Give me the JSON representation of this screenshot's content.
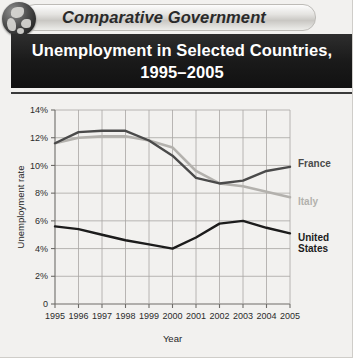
{
  "eyebrow": {
    "label": "Comparative Government",
    "icon": "globe-icon"
  },
  "title": {
    "line1": "Unemployment in Selected Countries,",
    "line2": "1995–2005"
  },
  "colors": {
    "page_background": "#f2f1ef",
    "title_bar": "#1a1a1a",
    "title_text": "#ffffff",
    "grid": "#a8a6a3",
    "axis": "#6e6c69",
    "france": "#4a4a4a",
    "italy": "#b3b1ad",
    "united_states": "#1c1c1c"
  },
  "chart_data": {
    "type": "line",
    "title": "Unemployment in Selected Countries, 1995–2005",
    "xlabel": "Year",
    "ylabel": "Unemployment rate",
    "x": [
      1995,
      1996,
      1997,
      1998,
      1999,
      2000,
      2001,
      2002,
      2003,
      2004,
      2005
    ],
    "categories": [
      "1995",
      "1996",
      "1997",
      "1998",
      "1999",
      "2000",
      "2001",
      "2002",
      "2003",
      "2004",
      "2005"
    ],
    "ylim": [
      0,
      14
    ],
    "yticks": [
      0,
      2,
      4,
      6,
      8,
      10,
      12,
      14
    ],
    "ytick_labels": [
      "0",
      "2%",
      "4%",
      "6%",
      "8%",
      "10%",
      "12%",
      "14%"
    ],
    "grid": true,
    "legend_position": "right-inline",
    "series": [
      {
        "name": "France",
        "color": "#4a4a4a",
        "values": [
          11.6,
          12.4,
          12.5,
          12.5,
          11.8,
          10.7,
          9.1,
          8.7,
          8.9,
          9.6,
          9.9
        ]
      },
      {
        "name": "Italy",
        "color": "#b3b1ad",
        "values": [
          11.6,
          12.0,
          12.1,
          12.1,
          11.8,
          11.3,
          9.6,
          8.7,
          8.5,
          8.1,
          7.7
        ]
      },
      {
        "name": "United States",
        "color": "#1c1c1c",
        "values": [
          5.6,
          5.4,
          5.0,
          4.6,
          4.3,
          4.0,
          4.8,
          5.8,
          6.0,
          5.5,
          5.1
        ]
      }
    ]
  }
}
